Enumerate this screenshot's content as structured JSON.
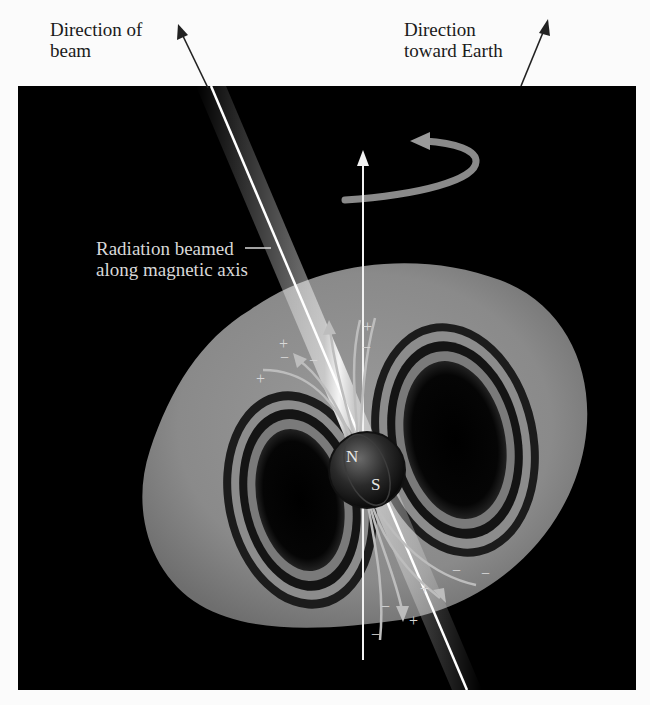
{
  "figure": {
    "background_color": "#000000",
    "page_color": "#fbfbfb"
  },
  "labels": {
    "beam_direction": "Direction of\nbeam",
    "earth_direction": "Direction\ntoward Earth",
    "radiation": "Radiation beamed\nalong magnetic axis"
  },
  "star": {
    "north_pole": "N",
    "south_pole": "S"
  },
  "charges": {
    "plus": "+",
    "minus": "−"
  },
  "elements": [
    {
      "name": "rotation-axis",
      "description": "vertical white arrow through the star"
    },
    {
      "name": "rotation-arrow",
      "description": "curved arrow around rotation axis"
    },
    {
      "name": "radiation-beam",
      "description": "bright beam along magnetic axis"
    },
    {
      "name": "magnetosphere",
      "description": "gray torus of magnetic field lines"
    },
    {
      "name": "neutron-star",
      "description": "dark sphere labeled N and S"
    }
  ]
}
